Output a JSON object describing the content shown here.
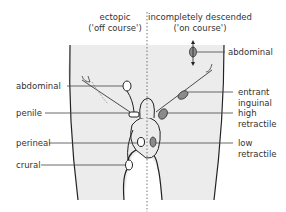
{
  "headers": {
    "left": {
      "line1": "ectopic",
      "line2": "('off course')"
    },
    "right": {
      "line1": "incompletely descended",
      "line2": "('on course')"
    }
  },
  "left_labels": [
    {
      "text": "abdominal"
    },
    {
      "text": "penile"
    },
    {
      "text": "perineal"
    },
    {
      "text": "crural"
    }
  ],
  "right_labels": [
    {
      "text": "abdominal"
    },
    {
      "text": "entrant"
    },
    {
      "text": "inguinal"
    },
    {
      "text": "high"
    },
    {
      "text": "retractile"
    },
    {
      "text": "low"
    },
    {
      "text": "retractile"
    }
  ],
  "colors": {
    "body_fill": "#ececec",
    "outline": "#222222",
    "testis_grey": "#8a8a8a",
    "leader": "#444444"
  }
}
